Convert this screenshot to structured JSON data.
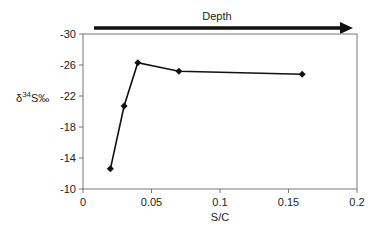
{
  "chart_data": {
    "type": "line",
    "title": "",
    "annotation": "Depth",
    "annotation_arrow": "left-to-right",
    "xlabel": "S/C",
    "ylabel": "δ34S‰",
    "ylabel_parts": {
      "prefix": "δ",
      "superscript": "34",
      "suffix": "S‰"
    },
    "xlim": [
      0,
      0.2
    ],
    "ylim": [
      -10,
      -30
    ],
    "y_inverted": true,
    "x_ticks": [
      "0",
      "0.05",
      "0.1",
      "0.15",
      "0.2"
    ],
    "x_tick_values": [
      0,
      0.05,
      0.1,
      0.15,
      0.2
    ],
    "y_ticks": [
      "-30",
      "-26",
      "-22",
      "-18",
      "-14",
      "-10"
    ],
    "y_tick_values": [
      -30,
      -26,
      -22,
      -18,
      -14,
      -10
    ],
    "grid": false,
    "legend": null,
    "series": [
      {
        "name": "δ34S vs S/C",
        "marker": "diamond",
        "color": "#111111",
        "x": [
          0.02,
          0.03,
          0.04,
          0.07,
          0.16
        ],
        "y": [
          -12.6,
          -20.7,
          -26.3,
          -25.2,
          -24.8
        ]
      }
    ]
  }
}
